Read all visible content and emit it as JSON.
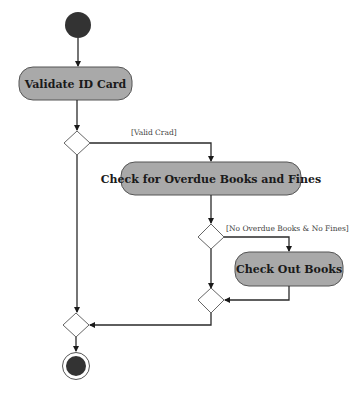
{
  "diagram": {
    "type": "UML activity diagram",
    "colors": {
      "action_fill": "#a9a9a9",
      "action_stroke": "#555555",
      "node_fill": "#333333",
      "edge": "#2a2a2a",
      "background": "#ffffff"
    },
    "nodes": {
      "start": {
        "kind": "initial",
        "label": ""
      },
      "validate": {
        "kind": "action",
        "label": "Validate ID Card"
      },
      "decision1": {
        "kind": "decision",
        "label": ""
      },
      "check_overdue": {
        "kind": "action",
        "label": "Check for Overdue Books and Fines"
      },
      "decision2": {
        "kind": "decision",
        "label": ""
      },
      "check_out": {
        "kind": "action",
        "label": "Check Out Books"
      },
      "merge1": {
        "kind": "merge",
        "label": ""
      },
      "merge2": {
        "kind": "merge",
        "label": ""
      },
      "end": {
        "kind": "final",
        "label": ""
      }
    },
    "guards": {
      "valid_card": "[Valid Crad]",
      "no_overdue": "[No Overdue Books & No Fines]"
    },
    "edges": [
      {
        "from": "start",
        "to": "validate"
      },
      {
        "from": "validate",
        "to": "decision1"
      },
      {
        "from": "decision1",
        "to": "check_overdue",
        "guard": "[Valid Crad]"
      },
      {
        "from": "decision1",
        "to": "merge2"
      },
      {
        "from": "check_overdue",
        "to": "decision2"
      },
      {
        "from": "decision2",
        "to": "check_out",
        "guard": "[No Overdue Books & No Fines]"
      },
      {
        "from": "decision2",
        "to": "merge1"
      },
      {
        "from": "check_out",
        "to": "merge1"
      },
      {
        "from": "merge1",
        "to": "merge2"
      },
      {
        "from": "merge2",
        "to": "end"
      }
    ]
  }
}
